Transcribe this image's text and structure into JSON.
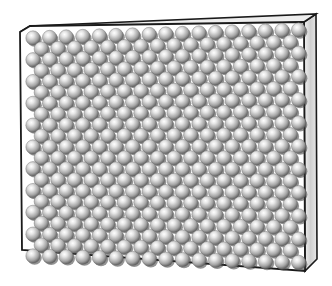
{
  "figure": {
    "panel": {
      "front": [
        [
          20,
          32
        ],
        [
          30,
          26
        ],
        [
          304,
          22
        ],
        [
          305,
          271
        ],
        [
          22,
          250
        ]
      ],
      "side": [
        [
          304,
          22
        ],
        [
          316,
          14
        ],
        [
          317,
          259
        ],
        [
          305,
          271
        ]
      ],
      "top": [
        [
          20,
          32
        ],
        [
          30,
          26
        ],
        [
          316,
          14
        ],
        [
          304,
          22
        ]
      ],
      "colors": {
        "front": "#ffffff",
        "side": "#d8d8d8",
        "top": "#eeeeee",
        "stroke": "#1a1a1a"
      }
    },
    "spheres": {
      "rows": 21,
      "per_row": 17,
      "radius": 7.2,
      "dx": 16.6,
      "dy": 10.9,
      "origin": [
        33,
        38
      ],
      "stagger": 8.3,
      "skew_per_col": -0.5,
      "colors": {
        "light": "#f4f4f4",
        "mid": "#a8a8a8",
        "dark": "#505050",
        "shadow": "#3a3a3a"
      }
    }
  }
}
